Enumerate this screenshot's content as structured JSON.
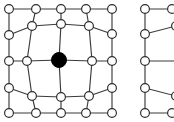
{
  "figure": {
    "background_color": "#ffffff",
    "edge_color": "#3a3a3a",
    "node_outline_color": "#2b2b2b",
    "node_fill_color": "#ffffff",
    "highlight_node_color": "#000000",
    "node_radius": 4.4,
    "highlight_node_radius": 7.5,
    "edge_width": 1.15,
    "width": 174,
    "height": 122
  },
  "chart_data": {
    "type": "diagram",
    "subtype": "graph-mesh",
    "panels": [
      {
        "name": "left-mesh",
        "label": "Complete 5 by 5 deformed mesh",
        "node_count": 25,
        "highlighted_nodes": [
          "c2r2"
        ],
        "nodes": [
          {
            "id": "c0r0",
            "x": 9,
            "y": 9,
            "style": "open"
          },
          {
            "id": "c1r0",
            "x": 36,
            "y": 9,
            "style": "open"
          },
          {
            "id": "c2r0",
            "x": 61,
            "y": 9,
            "style": "open"
          },
          {
            "id": "c3r0",
            "x": 86,
            "y": 9,
            "style": "open"
          },
          {
            "id": "c4r0",
            "x": 112,
            "y": 9,
            "style": "open"
          },
          {
            "id": "c0r1",
            "x": 9,
            "y": 35,
            "style": "open"
          },
          {
            "id": "c1r1",
            "x": 32,
            "y": 26,
            "style": "open"
          },
          {
            "id": "c2r1",
            "x": 61,
            "y": 24,
            "style": "open"
          },
          {
            "id": "c3r1",
            "x": 89,
            "y": 26,
            "style": "open"
          },
          {
            "id": "c4r1",
            "x": 112,
            "y": 34,
            "style": "open"
          },
          {
            "id": "c0r2",
            "x": 9,
            "y": 61,
            "style": "open"
          },
          {
            "id": "c1r2",
            "x": 27,
            "y": 61,
            "style": "open"
          },
          {
            "id": "c2r2",
            "x": 59,
            "y": 60,
            "style": "filled"
          },
          {
            "id": "c3r2",
            "x": 92,
            "y": 61,
            "style": "open"
          },
          {
            "id": "c4r2",
            "x": 112,
            "y": 61,
            "style": "open"
          },
          {
            "id": "c0r3",
            "x": 9,
            "y": 88,
            "style": "open"
          },
          {
            "id": "c1r3",
            "x": 32,
            "y": 96,
            "style": "open"
          },
          {
            "id": "c2r3",
            "x": 61,
            "y": 97,
            "style": "open"
          },
          {
            "id": "c3r3",
            "x": 89,
            "y": 96,
            "style": "open"
          },
          {
            "id": "c4r3",
            "x": 112,
            "y": 88,
            "style": "open"
          },
          {
            "id": "c0r4",
            "x": 9,
            "y": 113,
            "style": "open"
          },
          {
            "id": "c1r4",
            "x": 36,
            "y": 113,
            "style": "open"
          },
          {
            "id": "c2r4",
            "x": 61,
            "y": 113,
            "style": "open"
          },
          {
            "id": "c3r4",
            "x": 86,
            "y": 113,
            "style": "open"
          },
          {
            "id": "c4r4",
            "x": 112,
            "y": 113,
            "style": "open"
          }
        ],
        "edges": [
          [
            "c0r0",
            "c1r0"
          ],
          [
            "c1r0",
            "c2r0"
          ],
          [
            "c2r0",
            "c3r0"
          ],
          [
            "c3r0",
            "c4r0"
          ],
          [
            "c0r1",
            "c1r1"
          ],
          [
            "c1r1",
            "c2r1"
          ],
          [
            "c2r1",
            "c3r1"
          ],
          [
            "c3r1",
            "c4r1"
          ],
          [
            "c0r2",
            "c1r2"
          ],
          [
            "c1r2",
            "c2r2"
          ],
          [
            "c2r2",
            "c3r2"
          ],
          [
            "c3r2",
            "c4r2"
          ],
          [
            "c0r3",
            "c1r3"
          ],
          [
            "c1r3",
            "c2r3"
          ],
          [
            "c2r3",
            "c3r3"
          ],
          [
            "c3r3",
            "c4r3"
          ],
          [
            "c0r4",
            "c1r4"
          ],
          [
            "c1r4",
            "c2r4"
          ],
          [
            "c2r4",
            "c3r4"
          ],
          [
            "c3r4",
            "c4r4"
          ],
          [
            "c0r0",
            "c0r1"
          ],
          [
            "c0r1",
            "c0r2"
          ],
          [
            "c0r2",
            "c0r3"
          ],
          [
            "c0r3",
            "c0r4"
          ],
          [
            "c1r0",
            "c1r1"
          ],
          [
            "c1r1",
            "c1r2"
          ],
          [
            "c1r2",
            "c1r3"
          ],
          [
            "c1r3",
            "c1r4"
          ],
          [
            "c2r0",
            "c2r1"
          ],
          [
            "c2r1",
            "c2r2"
          ],
          [
            "c2r2",
            "c2r3"
          ],
          [
            "c2r3",
            "c2r4"
          ],
          [
            "c3r0",
            "c3r1"
          ],
          [
            "c3r1",
            "c3r2"
          ],
          [
            "c3r2",
            "c3r3"
          ],
          [
            "c3r3",
            "c3r4"
          ],
          [
            "c4r0",
            "c4r1"
          ],
          [
            "c4r1",
            "c4r2"
          ],
          [
            "c4r2",
            "c4r3"
          ],
          [
            "c4r3",
            "c4r4"
          ]
        ]
      },
      {
        "name": "right-mesh-fragment",
        "label": "Partially cropped mesh fragment at right image edge",
        "node_count": 10,
        "highlighted_nodes": [],
        "nodes": [
          {
            "id": "r0c0",
            "x": 145,
            "y": 9,
            "style": "open"
          },
          {
            "id": "r1c0",
            "x": 145,
            "y": 34,
            "style": "open"
          },
          {
            "id": "r2c0",
            "x": 145,
            "y": 61,
            "style": "open"
          },
          {
            "id": "r3c0",
            "x": 145,
            "y": 88,
            "style": "open"
          },
          {
            "id": "r4c0",
            "x": 145,
            "y": 113,
            "style": "open"
          },
          {
            "id": "r0c1",
            "x": 172,
            "y": 9,
            "style": "open"
          },
          {
            "id": "r1c1",
            "x": 176,
            "y": 26,
            "style": "open"
          },
          {
            "id": "r2c1",
            "x": 179,
            "y": 61,
            "style": "open"
          },
          {
            "id": "r3c1",
            "x": 176,
            "y": 96,
            "style": "open"
          },
          {
            "id": "r4c1",
            "x": 172,
            "y": 113,
            "style": "open"
          }
        ],
        "edges": [
          [
            "r0c0",
            "r1c0"
          ],
          [
            "r1c0",
            "r2c0"
          ],
          [
            "r2c0",
            "r3c0"
          ],
          [
            "r3c0",
            "r4c0"
          ],
          [
            "r0c0",
            "r0c1"
          ],
          [
            "r1c0",
            "r1c1"
          ],
          [
            "r2c0",
            "r2c1"
          ],
          [
            "r3c0",
            "r3c1"
          ],
          [
            "r4c0",
            "r4c1"
          ]
        ]
      }
    ]
  }
}
